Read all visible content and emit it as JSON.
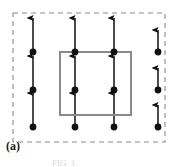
{
  "figure": {
    "panel_label": "(a)",
    "caption_fragment": "FIG. 1.",
    "width": 178,
    "height": 167,
    "background_color": "#ffffff"
  },
  "colors": {
    "arrow": "#111111",
    "dot": "#111111",
    "unit_cell_border": "#8a8a8a",
    "boundary_dashed": "#8a8a8a",
    "label_text": "#1a1a1a"
  },
  "boundary": {
    "name": "dashed-supercell-boundary",
    "style": "dashed",
    "stroke_color": "#8a8a8a",
    "stroke_width": 1.1,
    "dash_pattern": "5,4",
    "x": 13,
    "y": 13,
    "width": 152,
    "height": 129
  },
  "unit_cell": {
    "name": "solid-unit-cell-rectangle",
    "style": "solid",
    "stroke_color": "#8a8a8a",
    "stroke_width": 2.0,
    "x": 60,
    "y": 52,
    "width": 71,
    "height": 63
  },
  "lattice": {
    "columns": 4,
    "rows": 3,
    "column_x": [
      33,
      75,
      114,
      158
    ],
    "row_y": [
      52,
      90,
      127
    ],
    "dot_radius": 3.4,
    "arrow_direction": "up",
    "arrow_head_width": 5.2,
    "arrow_head_length": 7.0
  },
  "spins": [
    {
      "id": "spin-c1-r1",
      "col": 1,
      "row": 1,
      "x": 33,
      "y": 52,
      "length": 34,
      "direction": "up"
    },
    {
      "id": "spin-c1-r2",
      "col": 1,
      "row": 2,
      "x": 33,
      "y": 90,
      "length": 34,
      "direction": "up"
    },
    {
      "id": "spin-c1-r3",
      "col": 1,
      "row": 3,
      "x": 33,
      "y": 127,
      "length": 34,
      "direction": "up"
    },
    {
      "id": "spin-c2-r1",
      "col": 2,
      "row": 1,
      "x": 75,
      "y": 52,
      "length": 34,
      "direction": "up"
    },
    {
      "id": "spin-c2-r2",
      "col": 2,
      "row": 2,
      "x": 75,
      "y": 90,
      "length": 34,
      "direction": "up"
    },
    {
      "id": "spin-c2-r3",
      "col": 2,
      "row": 3,
      "x": 75,
      "y": 127,
      "length": 34,
      "direction": "up"
    },
    {
      "id": "spin-c3-r1",
      "col": 3,
      "row": 1,
      "x": 114,
      "y": 52,
      "length": 34,
      "direction": "up"
    },
    {
      "id": "spin-c3-r2",
      "col": 3,
      "row": 2,
      "x": 114,
      "y": 90,
      "length": 34,
      "direction": "up"
    },
    {
      "id": "spin-c3-r3",
      "col": 3,
      "row": 3,
      "x": 114,
      "y": 127,
      "length": 34,
      "direction": "up"
    },
    {
      "id": "spin-c4-r1",
      "col": 4,
      "row": 1,
      "x": 158,
      "y": 52,
      "length": 22,
      "direction": "up"
    },
    {
      "id": "spin-c4-r2",
      "col": 4,
      "row": 2,
      "x": 158,
      "y": 90,
      "length": 22,
      "direction": "up"
    },
    {
      "id": "spin-c4-r3",
      "col": 4,
      "row": 3,
      "x": 158,
      "y": 127,
      "length": 22,
      "direction": "up"
    }
  ]
}
